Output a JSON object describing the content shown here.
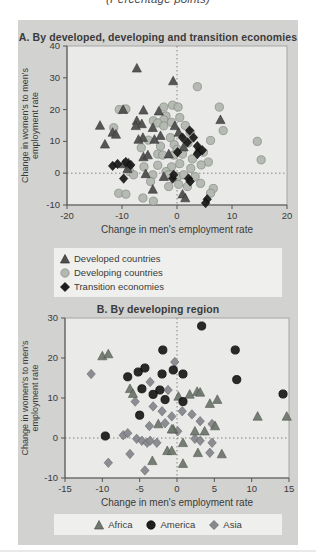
{
  "page": {
    "caption": "(Percentage points)"
  },
  "colors": {
    "panel_background": "#d2d2d0",
    "plot_background": "#eaeae8",
    "legend_background": "#efefed",
    "frame": "#9a9a98",
    "axis": "#555553",
    "text": "#3a3a3a",
    "reference_line": "#6a6a68"
  },
  "chart_data": [
    {
      "type": "scatter",
      "title": "A. By developed, developing and transition economies",
      "xlabel": "Change in men's employment rate",
      "ylabel_line1": "Change in women's to men's",
      "ylabel_line2": "employment rate",
      "xlim": [
        -20,
        20
      ],
      "ylim": [
        -10,
        40
      ],
      "xticks": [
        -20,
        -10,
        0,
        10,
        20
      ],
      "yticks": [
        -10,
        0,
        10,
        20,
        30,
        40
      ],
      "grid": "dotted reference lines at x=0 and y=0 only",
      "legend_position": "bottom",
      "series": [
        {
          "name": "Developed countries",
          "marker": "triangle",
          "color": "#4f4f4f",
          "stroke": "#303030",
          "points": [
            [
              -7.3,
              33
            ],
            [
              -0.7,
              29
            ],
            [
              -14,
              15
            ],
            [
              -11.7,
              12.8
            ],
            [
              -13.1,
              9.1
            ],
            [
              -9.8,
              20
            ],
            [
              -6.1,
              19.8
            ],
            [
              -3.3,
              19.5
            ],
            [
              -7.3,
              16.5
            ],
            [
              -6.4,
              15.5
            ],
            [
              -7.5,
              14.9
            ],
            [
              -4.4,
              14.3
            ],
            [
              -0.4,
              14.9
            ],
            [
              -11.1,
              12.2
            ],
            [
              -6.2,
              11.2
            ],
            [
              -3,
              11.8
            ],
            [
              -7,
              10.6
            ],
            [
              -4.1,
              10.6
            ],
            [
              0.3,
              12.8
            ],
            [
              1.2,
              8.2
            ],
            [
              3.9,
              7.5
            ],
            [
              7.9,
              16.8
            ],
            [
              -6.1,
              5.1
            ],
            [
              -5.3,
              5.7
            ],
            [
              -1.5,
              6
            ],
            [
              -9,
              1.4
            ],
            [
              -8.8,
              3.2
            ],
            [
              -9.7,
              2.9
            ],
            [
              -5.7,
              -0.2
            ],
            [
              -2.4,
              -1.1
            ],
            [
              -4.4,
              -5.1
            ],
            [
              1,
              -6.6
            ],
            [
              1.5,
              -7.8
            ]
          ]
        },
        {
          "name": "Developing countries",
          "marker": "circle",
          "color": "#b3b9b1",
          "stroke": "#878d85",
          "points": [
            [
              3.7,
              27.2
            ],
            [
              7.7,
              20.8
            ],
            [
              -10.5,
              20
            ],
            [
              -9.3,
              20.2
            ],
            [
              -2.4,
              20.8
            ],
            [
              -0.8,
              21.4
            ],
            [
              0.2,
              20.8
            ],
            [
              -2,
              18
            ],
            [
              -4.3,
              16.5
            ],
            [
              -2.4,
              16.8
            ],
            [
              -11.5,
              14.3
            ],
            [
              -3.5,
              15.8
            ],
            [
              -2.4,
              14.9
            ],
            [
              -1,
              16
            ],
            [
              0.5,
              17.5
            ],
            [
              2.4,
              12.8
            ],
            [
              1.5,
              15
            ],
            [
              -5.2,
              10.4
            ],
            [
              -1.2,
              11.2
            ],
            [
              6.1,
              10.3
            ],
            [
              8.4,
              13.4
            ],
            [
              14.6,
              10
            ],
            [
              15.3,
              4.2
            ],
            [
              -6.5,
              8
            ],
            [
              -3,
              8.5
            ],
            [
              -0.5,
              9
            ],
            [
              2,
              9.5
            ],
            [
              0,
              7.5
            ],
            [
              -3.5,
              6
            ],
            [
              -2.6,
              5.7
            ],
            [
              -0.6,
              5.7
            ],
            [
              1,
              6
            ],
            [
              4.8,
              6.6
            ],
            [
              5.7,
              3.5
            ],
            [
              2.8,
              4.5
            ],
            [
              4.4,
              2.6
            ],
            [
              -8.6,
              0.5
            ],
            [
              -6,
              2
            ],
            [
              -3.5,
              2.5
            ],
            [
              -1,
              2
            ],
            [
              0.5,
              3
            ],
            [
              2.5,
              1.5
            ],
            [
              -7.9,
              -0.5
            ],
            [
              -4.4,
              -0.5
            ],
            [
              -2,
              0.5
            ],
            [
              -1.5,
              -0.5
            ],
            [
              0.1,
              -1.1
            ],
            [
              1.2,
              -0.5
            ],
            [
              3.3,
              -1.1
            ],
            [
              -4.8,
              -2.6
            ],
            [
              -1.5,
              -4.2
            ],
            [
              0.3,
              -3.5
            ],
            [
              1.9,
              -4.2
            ],
            [
              4.3,
              -3.2
            ],
            [
              6.6,
              -4.8
            ],
            [
              6.1,
              -6.3
            ],
            [
              -10.6,
              -6.3
            ],
            [
              -9.3,
              -6.6
            ],
            [
              -6.2,
              -7.8
            ],
            [
              -4.3,
              -8.8
            ]
          ]
        },
        {
          "name": "Transition economies",
          "marker": "diamond",
          "color": "#1d1d1d",
          "stroke": "#000000",
          "points": [
            [
              -11.7,
              2.3
            ],
            [
              1,
              11.2
            ],
            [
              3,
              11.2
            ],
            [
              1.9,
              9.7
            ],
            [
              3.7,
              8.5
            ],
            [
              4.6,
              7.2
            ],
            [
              -10.8,
              2.9
            ],
            [
              -9.3,
              3.5
            ],
            [
              -8.4,
              2.6
            ],
            [
              0.1,
              6.6
            ],
            [
              3.7,
              6
            ],
            [
              -9.7,
              -1.7
            ],
            [
              -0.8,
              -1.7
            ],
            [
              -0.6,
              -0.5
            ],
            [
              2.1,
              -1.7
            ],
            [
              2.4,
              -2.6
            ],
            [
              5.5,
              -8.2
            ],
            [
              5.2,
              -9.4
            ],
            [
              2.3,
              13.4
            ]
          ]
        }
      ]
    },
    {
      "type": "scatter",
      "title": "B. By developing region",
      "xlabel": "Change in men's employment rate",
      "ylabel_line1": "Change in women's to men's",
      "ylabel_line2": "employment rate",
      "xlim": [
        -15,
        15
      ],
      "ylim": [
        -10,
        30
      ],
      "xticks": [
        -15,
        -10,
        -5,
        0,
        5,
        10,
        15
      ],
      "yticks": [
        -10,
        0,
        10,
        20,
        30
      ],
      "grid": "dotted reference lines at x=0 and y=0 only",
      "legend_position": "bottom",
      "series": [
        {
          "name": "Africa",
          "marker": "triangle",
          "color": "#6f786e",
          "stroke": "#4b524a",
          "points": [
            [
              -10,
              20.5
            ],
            [
              -9.2,
              21
            ],
            [
              -6.3,
              12.3
            ],
            [
              -5.9,
              11.1
            ],
            [
              0.2,
              10.4
            ],
            [
              1.7,
              10.9
            ],
            [
              2.7,
              11.6
            ],
            [
              3.1,
              11.4
            ],
            [
              5.4,
              9.6
            ],
            [
              4.4,
              8.6
            ],
            [
              10.8,
              5.4
            ],
            [
              14.7,
              5.4
            ],
            [
              5.1,
              3
            ],
            [
              3.7,
              1.7
            ],
            [
              2.4,
              1.7
            ],
            [
              -0.5,
              2.2
            ],
            [
              -2.5,
              3.5
            ],
            [
              -0.7,
              2.2
            ],
            [
              0.8,
              -1.2
            ],
            [
              -1.3,
              -3.2
            ],
            [
              -0.7,
              -3.2
            ],
            [
              2.8,
              -3.7
            ],
            [
              6,
              -4
            ],
            [
              -3.3,
              -5.7
            ],
            [
              0.8,
              -6.4
            ]
          ]
        },
        {
          "name": "America",
          "marker": "circle",
          "color": "#1f1f1f",
          "stroke": "#000000",
          "points": [
            [
              3.3,
              28
            ],
            [
              -1.9,
              22
            ],
            [
              7.8,
              22
            ],
            [
              8,
              14.6
            ],
            [
              14.2,
              11
            ],
            [
              -6.6,
              15.3
            ],
            [
              -5.2,
              16.5
            ],
            [
              -4.3,
              17.5
            ],
            [
              -2,
              16
            ],
            [
              -0.5,
              17
            ],
            [
              0.8,
              16
            ],
            [
              -4.7,
              12.3
            ],
            [
              -2.3,
              12
            ],
            [
              -3.2,
              10.9
            ],
            [
              -1.6,
              9.6
            ],
            [
              0.8,
              9.1
            ],
            [
              -5,
              5.7
            ],
            [
              -9.6,
              0.5
            ]
          ]
        },
        {
          "name": "Asia",
          "marker": "diamond",
          "color": "#87898f",
          "stroke": "#5f6166",
          "points": [
            [
              -11.5,
              16
            ],
            [
              -0.3,
              19
            ],
            [
              -3.6,
              14
            ],
            [
              -1.2,
              12
            ],
            [
              -5.6,
              9.1
            ],
            [
              -3.2,
              7.9
            ],
            [
              -2,
              6.7
            ],
            [
              -0.7,
              5.4
            ],
            [
              0.7,
              6.7
            ],
            [
              2,
              5.9
            ],
            [
              3.1,
              4.2
            ],
            [
              4.7,
              3.5
            ],
            [
              -3.7,
              3
            ],
            [
              -1.6,
              3.7
            ],
            [
              0.1,
              1.7
            ],
            [
              -7.2,
              0.7
            ],
            [
              -6.6,
              1.2
            ],
            [
              -5.4,
              -0.2
            ],
            [
              -4.7,
              -0.7
            ],
            [
              -4,
              -1.2
            ],
            [
              -3.6,
              -0.7
            ],
            [
              -2.7,
              -1.2
            ],
            [
              2.4,
              -0.2
            ],
            [
              3.1,
              -0.7
            ],
            [
              4.7,
              -1.2
            ],
            [
              4.4,
              -3.7
            ],
            [
              -6.3,
              -4
            ],
            [
              -9.2,
              -6.2
            ],
            [
              -4.3,
              -8.1
            ]
          ]
        }
      ]
    }
  ]
}
